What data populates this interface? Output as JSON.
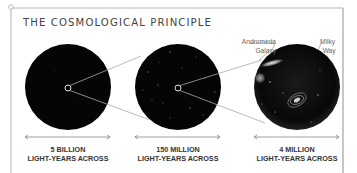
{
  "title": "THE COSMOLOGICAL PRINCIPLE",
  "panels": [
    {
      "scale_line1": "5 BILLION",
      "scale_line2": "LIGHT-YEARS ACROSS"
    },
    {
      "scale_line1": "150 MILLION",
      "scale_line2": "LIGHT-YEARS ACROSS"
    },
    {
      "scale_line1": "4 MILLION",
      "scale_line2": "LIGHT-YEARS ACROSS"
    }
  ],
  "annotations": {
    "andromeda_line1": "Andromeda",
    "andromeda_line2": "Galaxy",
    "milkyway_line1": "Milky",
    "milkyway_line2": "Way"
  },
  "colors": {
    "frame": "#b0b0b0",
    "circle": "#050505",
    "connector": "#a8a8a8",
    "text": "#333333"
  }
}
